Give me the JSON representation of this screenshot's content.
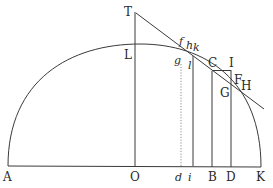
{
  "figure": {
    "colors": {
      "line": "#3a3a3a",
      "text": "#2a2a2a",
      "dotted": "#8a8a8a",
      "background": "#ffffff"
    },
    "labels": {
      "A": "A",
      "O": "O",
      "d": "d",
      "i": "i",
      "B": "B",
      "D": "D",
      "K": "K",
      "T": "T",
      "L": "L",
      "f": "f",
      "h": "h",
      "k": "k",
      "g": "g",
      "l": "l",
      "C": "C",
      "I": "I",
      "F": "F",
      "H": "H",
      "G": "G"
    },
    "elements": [
      "baseline AK",
      "semicircle arc from A through L to K",
      "vertical TO",
      "tangent line from T through C to H",
      "dotted ordinate d-g",
      "ordinate i-l",
      "ordinate B-C",
      "ordinate D-G extended to I",
      "segment C-I"
    ]
  }
}
